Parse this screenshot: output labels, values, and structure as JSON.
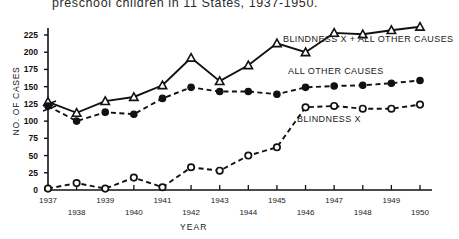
{
  "title": "preschool children in 11 States, 1937-1950.",
  "axes": {
    "ylabel": "NO. OF CASES",
    "xlabel": "YEAR",
    "yticks": [
      "0",
      "25",
      "50",
      "75",
      "100",
      "125",
      "150",
      "175",
      "200",
      "225"
    ],
    "xticks": [
      "1937",
      "1938",
      "1939",
      "1940",
      "1941",
      "1942",
      "1943",
      "1944",
      "1945",
      "1946",
      "1947",
      "1948",
      "1949",
      "1950"
    ]
  },
  "chart_data": {
    "type": "line",
    "title": "preschool children in 11 States, 1937-1950.",
    "xlabel": "YEAR",
    "ylabel": "NO. OF CASES",
    "x": [
      1937,
      1938,
      1939,
      1940,
      1941,
      1942,
      1943,
      1944,
      1945,
      1946,
      1947,
      1948,
      1949,
      1950
    ],
    "ylim": [
      0,
      240
    ],
    "xlim": [
      1937,
      1950
    ],
    "grid": false,
    "axis_break_at": 125,
    "legend_position": "inline-annotations",
    "series": [
      {
        "name": "BLINDNESS X + ALL OTHER CAUSES",
        "marker": "open-triangle",
        "linestyle": "solid",
        "values": [
          128,
          112,
          129,
          135,
          152,
          192,
          158,
          181,
          213,
          200,
          228,
          226,
          232,
          237
        ]
      },
      {
        "name": "ALL OTHER CAUSES",
        "marker": "filled-circle",
        "linestyle": "dashed",
        "values": [
          122,
          100,
          113,
          110,
          133,
          149,
          143,
          143,
          139,
          149,
          151,
          152,
          155,
          159
        ]
      },
      {
        "name": "BLINDNESS X",
        "marker": "open-circle",
        "linestyle": "dashed",
        "values": [
          2,
          10,
          2,
          18,
          4,
          33,
          28,
          50,
          62,
          120,
          122,
          118,
          118,
          124
        ]
      }
    ]
  }
}
